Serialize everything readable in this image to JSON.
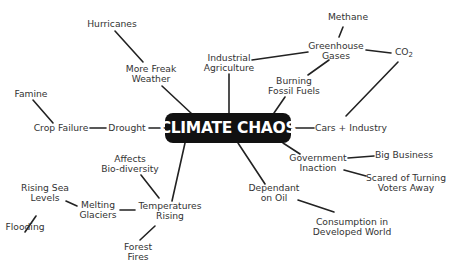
{
  "title": "CLIMATE CHAOS",
  "nodes": {
    "hurricanes": [
      "Hurricanes"
    ],
    "freak_weather": [
      "More Freak",
      "Weather"
    ],
    "famine": [
      "Famine"
    ],
    "crop_failure": [
      "Crop Failure"
    ],
    "drought": [
      "Drought"
    ],
    "industrial_agriculture": [
      "Industrial",
      "Agriculture"
    ],
    "methane": [
      "Methane"
    ],
    "greenhouse_gases": [
      "Greenhouse",
      "Gases"
    ],
    "co2": {
      "base": "CO",
      "sub": "2"
    },
    "burning_fossil_fuels": [
      "Burning",
      "Fossil Fuels"
    ],
    "cars_industry": [
      "Cars + Industry"
    ],
    "government_inaction": [
      "Government",
      "Inaction"
    ],
    "big_business": [
      "Big Business"
    ],
    "scared_voters": [
      "Scared of Turning",
      "Voters Away"
    ],
    "dependant_oil": [
      "Dependant",
      "on Oil"
    ],
    "consumption": [
      "Consumption in",
      "Developed World"
    ],
    "affects_biodiversity": [
      "Affects",
      "Bio-diversity"
    ],
    "temperatures_rising": [
      "Temperatures",
      "Rising"
    ],
    "melting_glaciers": [
      "Melting",
      "Glaciers"
    ],
    "rising_sea": [
      "Rising Sea",
      "Levels"
    ],
    "flooding": [
      "Flooding"
    ],
    "forest_fires": [
      "Forest",
      "Fires"
    ]
  }
}
